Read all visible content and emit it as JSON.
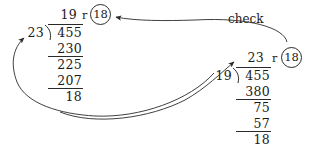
{
  "diagram": {
    "check_label": "check",
    "remainder_marker": "r",
    "ink_color": "#2a2a2a",
    "background_color": "#ffffff"
  },
  "left_division": {
    "name": "original-division",
    "quotient": "19",
    "divisor": "23",
    "dividend": "455",
    "remainder_marker": "r",
    "remainder": "18",
    "steps": [
      {
        "value": "230",
        "ruled": true
      },
      {
        "value": "225",
        "ruled": false
      },
      {
        "value": "207",
        "ruled": true
      },
      {
        "value": "18",
        "ruled": false
      }
    ]
  },
  "right_division": {
    "name": "check-division",
    "quotient": "23",
    "divisor": "19",
    "dividend": "455",
    "remainder_marker": "r",
    "remainder": "18",
    "steps": [
      {
        "value": "380",
        "ruled": true
      },
      {
        "value": "75",
        "ruled": false
      },
      {
        "value": "57",
        "ruled": true
      },
      {
        "value": "18",
        "ruled": false
      }
    ]
  },
  "arrows": [
    {
      "name": "check-arrow",
      "label": "check",
      "from": "left-remainder-circle",
      "to": "right-remainder-circle"
    },
    {
      "name": "quotient-to-divisor-arrow",
      "label": "",
      "from": "left-bottom-remainder",
      "to": "right-quotient"
    },
    {
      "name": "divisor-return-arrow",
      "label": "",
      "from": "right-division",
      "to": "left-divisor"
    }
  ]
}
